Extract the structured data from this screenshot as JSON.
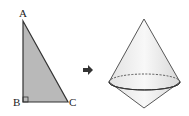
{
  "triangle": {
    "vertices": {
      "A": "A",
      "B": "B",
      "C": "C"
    },
    "fill": "#b8b8b8",
    "right_angle_at": "B"
  },
  "arrow": {
    "symbol": "➡",
    "color": "#333333"
  },
  "solid": {
    "name": "double-cone",
    "fill": "#eeeeee"
  }
}
